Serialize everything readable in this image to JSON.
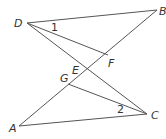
{
  "diagram": {
    "points": {
      "D": {
        "label": "D",
        "x": 27,
        "y": 23
      },
      "B": {
        "label": "B",
        "x": 157,
        "y": 10
      },
      "A": {
        "label": "A",
        "x": 19,
        "y": 126
      },
      "C": {
        "label": "C",
        "x": 147,
        "y": 114
      },
      "F": {
        "label": "F",
        "x": 108,
        "y": 55
      },
      "G": {
        "label": "G",
        "x": 68,
        "y": 84
      },
      "E": {
        "label": "E",
        "x": 88,
        "y": 70
      }
    },
    "segments": [
      [
        "D",
        "B"
      ],
      [
        "D",
        "F"
      ],
      [
        "D",
        "C"
      ],
      [
        "A",
        "B"
      ],
      [
        "A",
        "C"
      ],
      [
        "G",
        "C"
      ]
    ],
    "angles": [
      {
        "label": "1",
        "vertex": "D"
      },
      {
        "label": "2",
        "vertex": "C"
      }
    ]
  }
}
